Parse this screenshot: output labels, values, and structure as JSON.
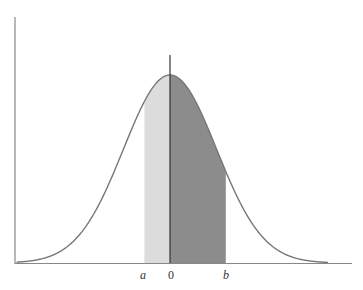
{
  "chart_data": {
    "type": "area",
    "title": "",
    "xlabel": "",
    "ylabel": "",
    "distribution": {
      "name": "normal",
      "mean": 0,
      "sd": 1
    },
    "tick_labels": [
      "a",
      "0",
      "b"
    ],
    "x_ticks": [
      -0.55,
      0,
      1.2
    ],
    "shaded_regions": [
      {
        "name": "a-to-0",
        "from": -0.55,
        "to": 0,
        "color": "#dcdcdc"
      },
      {
        "name": "0-to-b",
        "from": 0,
        "to": 1.2,
        "color": "#8c8c8c"
      }
    ],
    "xlim": [
      -3.3,
      3.4
    ],
    "grid": false,
    "legend": null,
    "colors": {
      "curve": "#777777",
      "axis": "#888888",
      "center_line": "#333333"
    }
  },
  "labels": {
    "a": "a",
    "zero": "0",
    "b": "b"
  }
}
